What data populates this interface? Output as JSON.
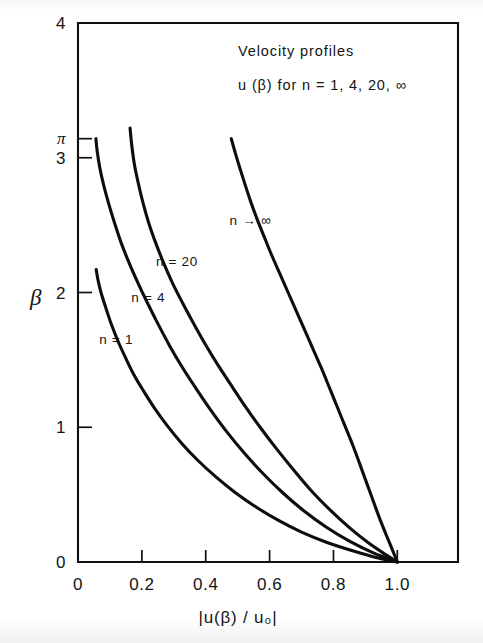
{
  "figure": {
    "background_color": "#fdfdfc",
    "ink_color": "#111111"
  },
  "chart_data": {
    "type": "line",
    "title": "Velocity profiles",
    "subtitle": "u (β) for n = 1, 4, 20, ∞",
    "xlabel": "|u(β) / u₀|",
    "ylabel": "β",
    "xlim": [
      0,
      1.19
    ],
    "ylim": [
      0,
      4
    ],
    "grid": false,
    "legend": "inline-curve-labels",
    "xticks": [
      0,
      0.2,
      0.4,
      0.6,
      0.8,
      1.0
    ],
    "xticklabels": [
      "0",
      "0.2",
      "0.4",
      "0.6",
      "0.8",
      "1.0"
    ],
    "yticks": [
      0,
      1,
      2,
      3,
      3.14159,
      4
    ],
    "yticklabels": [
      "0",
      "1",
      "2",
      "3",
      "π",
      "4"
    ],
    "series": [
      {
        "name": "n = 1",
        "label": "n = 1",
        "label_x": 0.12,
        "label_y": 1.62,
        "points": [
          [
            0.057,
            2.17
          ],
          [
            0.062,
            2.1
          ],
          [
            0.072,
            2.0
          ],
          [
            0.088,
            1.88
          ],
          [
            0.105,
            1.76
          ],
          [
            0.125,
            1.64
          ],
          [
            0.148,
            1.52
          ],
          [
            0.175,
            1.39
          ],
          [
            0.205,
            1.27
          ],
          [
            0.24,
            1.14
          ],
          [
            0.28,
            1.01
          ],
          [
            0.325,
            0.88
          ],
          [
            0.375,
            0.755
          ],
          [
            0.43,
            0.635
          ],
          [
            0.49,
            0.52
          ],
          [
            0.555,
            0.412
          ],
          [
            0.625,
            0.312
          ],
          [
            0.7,
            0.222
          ],
          [
            0.78,
            0.145
          ],
          [
            0.865,
            0.08
          ],
          [
            0.94,
            0.03
          ],
          [
            1.0,
            0.0
          ]
        ]
      },
      {
        "name": "n = 4",
        "label": "n = 4",
        "label_x": 0.22,
        "label_y": 1.93,
        "points": [
          [
            0.056,
            3.1416
          ],
          [
            0.06,
            3.05
          ],
          [
            0.068,
            2.93
          ],
          [
            0.08,
            2.8
          ],
          [
            0.096,
            2.66
          ],
          [
            0.114,
            2.52
          ],
          [
            0.135,
            2.37
          ],
          [
            0.16,
            2.22
          ],
          [
            0.188,
            2.07
          ],
          [
            0.218,
            1.92
          ],
          [
            0.252,
            1.76
          ],
          [
            0.288,
            1.6
          ],
          [
            0.328,
            1.44
          ],
          [
            0.372,
            1.28
          ],
          [
            0.418,
            1.12
          ],
          [
            0.468,
            0.96
          ],
          [
            0.522,
            0.805
          ],
          [
            0.58,
            0.655
          ],
          [
            0.642,
            0.512
          ],
          [
            0.708,
            0.378
          ],
          [
            0.778,
            0.258
          ],
          [
            0.85,
            0.155
          ],
          [
            0.925,
            0.068
          ],
          [
            1.0,
            0.0
          ]
        ]
      },
      {
        "name": "n = 20",
        "label": "n = 20",
        "label_x": 0.31,
        "label_y": 2.2,
        "points": [
          [
            0.163,
            3.22
          ],
          [
            0.168,
            3.1
          ],
          [
            0.176,
            2.96
          ],
          [
            0.188,
            2.82
          ],
          [
            0.203,
            2.67
          ],
          [
            0.221,
            2.52
          ],
          [
            0.243,
            2.37
          ],
          [
            0.268,
            2.22
          ],
          [
            0.296,
            2.07
          ],
          [
            0.328,
            1.92
          ],
          [
            0.362,
            1.77
          ],
          [
            0.4,
            1.61
          ],
          [
            0.44,
            1.455
          ],
          [
            0.483,
            1.3
          ],
          [
            0.528,
            1.14
          ],
          [
            0.575,
            0.985
          ],
          [
            0.625,
            0.83
          ],
          [
            0.678,
            0.675
          ],
          [
            0.732,
            0.525
          ],
          [
            0.79,
            0.385
          ],
          [
            0.85,
            0.255
          ],
          [
            0.905,
            0.15
          ],
          [
            0.955,
            0.068
          ],
          [
            1.0,
            0.0
          ]
        ]
      },
      {
        "name": "n → ∞",
        "label": "n → ∞",
        "label_x": 0.54,
        "label_y": 2.5,
        "points": [
          [
            0.48,
            3.1416
          ],
          [
            0.492,
            3.04
          ],
          [
            0.506,
            2.93
          ],
          [
            0.522,
            2.81
          ],
          [
            0.54,
            2.68
          ],
          [
            0.56,
            2.55
          ],
          [
            0.582,
            2.42
          ],
          [
            0.606,
            2.28
          ],
          [
            0.632,
            2.14
          ],
          [
            0.658,
            2.0
          ],
          [
            0.684,
            1.86
          ],
          [
            0.71,
            1.72
          ],
          [
            0.736,
            1.58
          ],
          [
            0.762,
            1.44
          ],
          [
            0.788,
            1.29
          ],
          [
            0.812,
            1.15
          ],
          [
            0.836,
            1.01
          ],
          [
            0.86,
            0.87
          ],
          [
            0.882,
            0.73
          ],
          [
            0.905,
            0.58
          ],
          [
            0.928,
            0.43
          ],
          [
            0.95,
            0.29
          ],
          [
            0.975,
            0.145
          ],
          [
            1.0,
            0.0
          ]
        ]
      }
    ]
  }
}
